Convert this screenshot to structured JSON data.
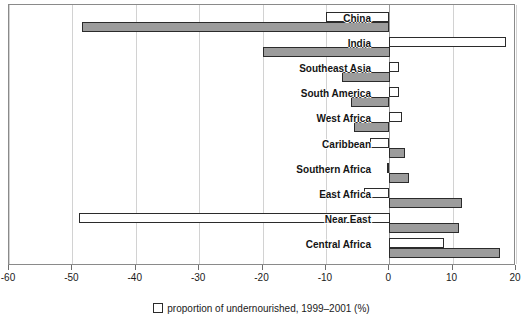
{
  "chart_data": {
    "type": "bar",
    "orientation": "horizontal",
    "title": "",
    "subtitle": "",
    "xlabel": "",
    "ylabel": "",
    "xlim": [
      -60,
      20
    ],
    "xticks": [
      -60,
      -50,
      -40,
      -30,
      -20,
      -10,
      0,
      10,
      20
    ],
    "xticklabels": [
      "-60",
      "-50",
      "-40",
      "-30",
      "-20",
      "-10",
      "0",
      "10",
      "20"
    ],
    "grid": true,
    "grid_axis": "x",
    "legend_position": "bottom",
    "categories": [
      "China",
      "India",
      "Southeast Asia",
      "South America",
      "West Africa",
      "Caribbean",
      "Southern Africa",
      "East Africa",
      "Near East",
      "Central Africa"
    ],
    "series": [
      {
        "name": "proportion of undernourished, 1999–2001 (%)",
        "style": "white",
        "color": "#ffffff",
        "edge_color": "#2b2b2b",
        "values": [
          -10.0,
          18.5,
          1.5,
          1.5,
          2.0,
          -3.0,
          -0.3,
          -4.0,
          -49.0,
          8.7
        ]
      },
      {
        "name": "change",
        "style": "gray",
        "color": "#9c9c9c",
        "edge_color": "#2b2b2b",
        "values": [
          -48.5,
          -20.0,
          -7.5,
          -6.0,
          -5.5,
          2.5,
          3.2,
          11.5,
          11.0,
          17.5
        ]
      }
    ]
  },
  "legend": {
    "items": [
      {
        "swatch": "white-square",
        "label": "proportion of undernourished, 1999–2001 (%)"
      }
    ]
  },
  "colors": {
    "white_bar": "#ffffff",
    "gray_bar": "#9c9c9c",
    "bar_edge": "#2b2b2b",
    "gridline": "#d2d2d2",
    "zeroline": "#9a9a9a",
    "frame": "#8a8a8a",
    "text": "#1a1a1a"
  }
}
